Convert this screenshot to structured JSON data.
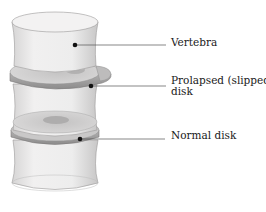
{
  "diagram": {
    "labels": {
      "vertebra": "Vertebra",
      "prolapsed_line1": "Prolapsed (slipped)",
      "prolapsed_line2": "disk",
      "normal": "Normal disk"
    },
    "colors": {
      "bone": "#ecebeb",
      "bone_shade": "#c9c8c8",
      "disk": "#a9a8a8",
      "disk_dark": "#8f8e8e",
      "leader_line": "#555555",
      "marker": "#111111"
    }
  }
}
